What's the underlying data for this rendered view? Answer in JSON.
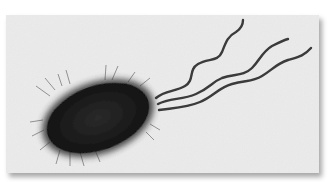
{
  "image": {
    "subject": "bacterium-with-flagella-micrograph",
    "alt": "Grayscale micrograph of a rod-shaped bacterium with fimbriae and several polar flagella",
    "colors": {
      "background": "#ececec",
      "cell_body": "#1b1b1b",
      "flagella": "#3a3a3a",
      "page": "#ffffff"
    }
  }
}
